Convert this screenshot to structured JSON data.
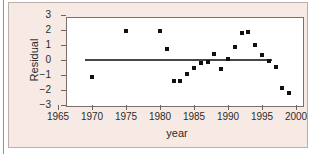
{
  "chart_data": {
    "type": "scatter",
    "title": "",
    "xlabel": "year",
    "ylabel": "Residual",
    "xlim": [
      1965,
      2000
    ],
    "ylim": [
      -3,
      3
    ],
    "xticks": [
      1965,
      1970,
      1975,
      1980,
      1985,
      1990,
      1995,
      2000
    ],
    "xtick_labels": [
      "1965",
      "1970",
      "1975",
      "1980",
      "1985",
      "1990",
      "1995",
      "2000"
    ],
    "yticks": [
      3,
      2,
      1,
      0,
      -1,
      -2,
      -3
    ],
    "ytick_labels": [
      "3",
      "2",
      "1",
      "0",
      "−1",
      "−2",
      "−3"
    ],
    "grid": false,
    "legend": null,
    "marker": "square",
    "marker_color": "#111111",
    "points": [
      {
        "x": 1970,
        "y": -1.12
      },
      {
        "x": 1975,
        "y": 1.95
      },
      {
        "x": 1980,
        "y": 1.95
      },
      {
        "x": 1981,
        "y": 0.72
      },
      {
        "x": 1982,
        "y": -1.4
      },
      {
        "x": 1983,
        "y": -1.42
      },
      {
        "x": 1984,
        "y": -0.95
      },
      {
        "x": 1985,
        "y": -0.52
      },
      {
        "x": 1986,
        "y": -0.17
      },
      {
        "x": 1987,
        "y": -0.12
      },
      {
        "x": 1988,
        "y": 0.38
      },
      {
        "x": 1989,
        "y": -0.58
      },
      {
        "x": 1990,
        "y": 0.08
      },
      {
        "x": 1991,
        "y": 0.88
      },
      {
        "x": 1992,
        "y": 1.78
      },
      {
        "x": 1993,
        "y": 1.85
      },
      {
        "x": 1994,
        "y": 0.98
      },
      {
        "x": 1995,
        "y": 0.33
      },
      {
        "x": 1996,
        "y": -0.08
      },
      {
        "x": 1997,
        "y": -0.45
      },
      {
        "x": 1998,
        "y": -1.88
      },
      {
        "x": 1999,
        "y": -2.22
      }
    ],
    "reference_line": {
      "type": "horizontal-trend",
      "y": 0.0,
      "x_start": 1969,
      "x_end": 1996.5,
      "color": "#4c4442"
    }
  }
}
